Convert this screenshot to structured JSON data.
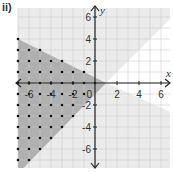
{
  "part_label": "ii)",
  "axes": {
    "x_name": "x",
    "y_name": "y",
    "origin_label": "0",
    "x_ticks": [
      {
        "value": -6,
        "label": "-6"
      },
      {
        "value": -4,
        "label": "-4"
      },
      {
        "value": -2,
        "label": "-2"
      },
      {
        "value": 2,
        "label": "2"
      },
      {
        "value": 4,
        "label": "4"
      },
      {
        "value": 6,
        "label": "6"
      }
    ],
    "y_ticks": [
      {
        "value": 6,
        "label": "6"
      },
      {
        "value": 4,
        "label": "4"
      },
      {
        "value": 2,
        "label": "2"
      },
      {
        "value": -2,
        "label": "-2"
      },
      {
        "value": -4,
        "label": "-4"
      },
      {
        "value": -6,
        "label": "-6"
      }
    ]
  },
  "regions": {
    "dark_shaded": {
      "description": "Region to the left bounded by two lines meeting at (1, 0)",
      "color": "#b0b0b0",
      "upper_boundary": "line through (-7, 4) and (1, 0)",
      "lower_boundary": "line through (-7, -7) and (1, 0)"
    },
    "light_shaded": {
      "description": "Lightly shaded area outside the white wedge on the right",
      "color": "#ebebeb"
    },
    "white_wedge": {
      "description": "Unshaded wedge opening to the right from (1, 0)",
      "color": "#ffffff"
    }
  },
  "lattice_dots": {
    "rows": [
      {
        "y": 4,
        "x": [
          -7
        ]
      },
      {
        "y": 3,
        "x": [
          -7,
          -6,
          -5
        ]
      },
      {
        "y": 2,
        "x": [
          -7,
          -6,
          -5,
          -4,
          -3
        ]
      },
      {
        "y": 1,
        "x": [
          -7,
          -6,
          -5,
          -4,
          -3,
          -2,
          -1
        ]
      },
      {
        "y": 0,
        "x": [
          -7,
          -6,
          -5,
          -4,
          -3,
          -2,
          -1,
          0
        ]
      },
      {
        "y": -1,
        "x": [
          -7,
          -6,
          -5,
          -4,
          -3,
          -2,
          -1
        ]
      },
      {
        "y": -2,
        "x": [
          -7,
          -6,
          -5,
          -4,
          -3,
          -2
        ]
      },
      {
        "y": -3,
        "x": [
          -7,
          -6,
          -5,
          -4,
          -3,
          -2
        ]
      },
      {
        "y": -4,
        "x": [
          -7,
          -6,
          -5,
          -4,
          -3
        ]
      },
      {
        "y": -5,
        "x": [
          -7,
          -6,
          -5,
          -4
        ]
      },
      {
        "y": -6,
        "x": [
          -7,
          -6,
          -5
        ]
      },
      {
        "y": -7,
        "x": [
          -7,
          -6
        ]
      }
    ]
  },
  "colors": {
    "grid": "#cfcfcf",
    "axis": "#222222",
    "dot": "#111111",
    "dark_region": "#b0b0b0",
    "light_region": "#ebebeb"
  }
}
